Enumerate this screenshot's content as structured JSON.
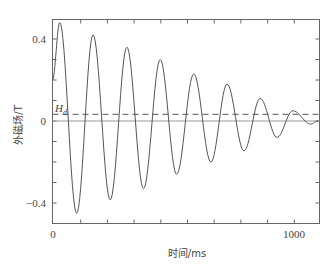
{
  "chart_data": {
    "type": "line",
    "title": "",
    "xlabel": "时间/ms",
    "ylabel": "外磁场/T",
    "xlim": [
      0,
      1100
    ],
    "ylim": [
      -0.5,
      0.5
    ],
    "x_tick_labels": [
      "0",
      "1000"
    ],
    "y_tick_labels": [
      "0.4",
      "0",
      "−0.4"
    ],
    "x_minor_tick_step_ms": 110,
    "y_minor_tick_step": 0.1,
    "grid": false,
    "legend": null,
    "annotations": [
      {
        "text": "H",
        "subscript": "d",
        "note": "dashed horizontal reference line",
        "y": 0.03
      }
    ],
    "series": [
      {
        "name": "外磁场 (damped oscillation)",
        "style": "solid",
        "color": "#555555",
        "extrema": [
          {
            "x": 0,
            "y": 0.2
          },
          {
            "x": 30,
            "y": 0.48
          },
          {
            "x": 100,
            "y": -0.45
          },
          {
            "x": 168,
            "y": 0.42
          },
          {
            "x": 239,
            "y": -0.385
          },
          {
            "x": 308,
            "y": 0.36
          },
          {
            "x": 377,
            "y": -0.33
          },
          {
            "x": 446,
            "y": 0.3
          },
          {
            "x": 514,
            "y": -0.26
          },
          {
            "x": 585,
            "y": 0.23
          },
          {
            "x": 656,
            "y": -0.2
          },
          {
            "x": 723,
            "y": 0.18
          },
          {
            "x": 793,
            "y": -0.146
          },
          {
            "x": 860,
            "y": 0.11
          },
          {
            "x": 930,
            "y": -0.08
          },
          {
            "x": 995,
            "y": 0.05
          },
          {
            "x": 1070,
            "y": -0.015
          },
          {
            "x": 1100,
            "y": 0.0
          }
        ]
      },
      {
        "name": "H_d",
        "style": "dashed",
        "color": "#777777",
        "x": [
          0,
          1100
        ],
        "y": [
          0.03,
          0.03
        ]
      },
      {
        "name": "zero line",
        "style": "solid",
        "color": "#999999",
        "x": [
          0,
          1100
        ],
        "y": [
          0,
          0
        ]
      }
    ]
  },
  "axes": {
    "x_label": "时间/ms",
    "y_label": "外磁场/T",
    "x_ticks": {
      "zero": "0",
      "thousand": "1000"
    },
    "y_ticks": {
      "top": "0.4",
      "zero": "0",
      "bottom": "−0.4"
    },
    "hd_label_main": "H",
    "hd_label_sub": "d"
  }
}
